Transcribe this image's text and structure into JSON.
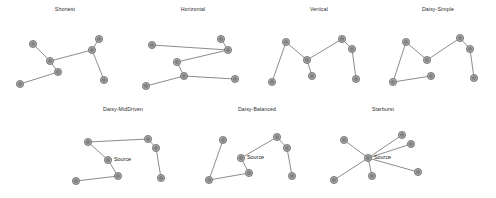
{
  "figure": {
    "width": 496,
    "height": 198,
    "background": "#ffffff",
    "node_fill": "#a6a6a6",
    "node_stroke": "#6a6a6a",
    "edge_color": "#6e6e6e",
    "title_color": "#2b2b2b",
    "node_radius": 3.6,
    "node_inner_radius": 1.5
  },
  "panels": [
    {
      "id": "shortest",
      "title": "Shortest",
      "box": {
        "left": 4,
        "top": 6,
        "width": 122,
        "height": 92
      },
      "view": {
        "width": 122,
        "height": 82
      },
      "nodes": [
        {
          "name": "node-a",
          "x": 29,
          "y": 30
        },
        {
          "name": "node-b",
          "x": 46,
          "y": 47
        },
        {
          "name": "node-c",
          "x": 54,
          "y": 58
        },
        {
          "name": "node-d",
          "x": 16,
          "y": 70
        },
        {
          "name": "node-e",
          "x": 88,
          "y": 36
        },
        {
          "name": "node-f",
          "x": 95,
          "y": 25
        },
        {
          "name": "node-g",
          "x": 100,
          "y": 66
        }
      ],
      "edges": [
        [
          0,
          1
        ],
        [
          1,
          2
        ],
        [
          2,
          3
        ],
        [
          1,
          4
        ],
        [
          4,
          5
        ],
        [
          4,
          6
        ]
      ],
      "labels": []
    },
    {
      "id": "horizontal",
      "title": "Horizontal",
      "box": {
        "left": 132,
        "top": 6,
        "width": 122,
        "height": 92
      },
      "view": {
        "width": 122,
        "height": 82
      },
      "nodes": [
        {
          "name": "node-a",
          "x": 20,
          "y": 31
        },
        {
          "name": "node-b",
          "x": 96,
          "y": 36
        },
        {
          "name": "node-c",
          "x": 89,
          "y": 25
        },
        {
          "name": "node-d",
          "x": 45,
          "y": 48
        },
        {
          "name": "node-e",
          "x": 52,
          "y": 62
        },
        {
          "name": "node-f",
          "x": 14,
          "y": 72
        },
        {
          "name": "node-g",
          "x": 103,
          "y": 65
        }
      ],
      "edges": [
        [
          0,
          1
        ],
        [
          1,
          2
        ],
        [
          1,
          3
        ],
        [
          3,
          4
        ],
        [
          4,
          5
        ],
        [
          4,
          6
        ]
      ],
      "labels": []
    },
    {
      "id": "vertical",
      "title": "Vertical",
      "box": {
        "left": 258,
        "top": 6,
        "width": 122,
        "height": 92
      },
      "view": {
        "width": 122,
        "height": 82
      },
      "nodes": [
        {
          "name": "node-a",
          "x": 28,
          "y": 28
        },
        {
          "name": "node-b",
          "x": 14,
          "y": 68
        },
        {
          "name": "node-c",
          "x": 49,
          "y": 46
        },
        {
          "name": "node-d",
          "x": 54,
          "y": 62
        },
        {
          "name": "node-e",
          "x": 84,
          "y": 25
        },
        {
          "name": "node-f",
          "x": 94,
          "y": 35
        },
        {
          "name": "node-g",
          "x": 98,
          "y": 65
        }
      ],
      "edges": [
        [
          0,
          1
        ],
        [
          0,
          2
        ],
        [
          2,
          3
        ],
        [
          2,
          4
        ],
        [
          4,
          5
        ],
        [
          5,
          6
        ]
      ],
      "labels": []
    },
    {
      "id": "daisy-simple",
      "title": "Daisy-Simple",
      "box": {
        "left": 380,
        "top": 6,
        "width": 116,
        "height": 92
      },
      "view": {
        "width": 116,
        "height": 82
      },
      "nodes": [
        {
          "name": "node-a",
          "x": 26,
          "y": 28
        },
        {
          "name": "node-b",
          "x": 13,
          "y": 68
        },
        {
          "name": "node-c",
          "x": 47,
          "y": 46
        },
        {
          "name": "node-d",
          "x": 51,
          "y": 62
        },
        {
          "name": "node-e",
          "x": 80,
          "y": 24
        },
        {
          "name": "node-f",
          "x": 90,
          "y": 35
        },
        {
          "name": "node-g",
          "x": 94,
          "y": 64
        }
      ],
      "edges": [
        [
          0,
          1
        ],
        [
          0,
          2
        ],
        [
          1,
          3
        ],
        [
          2,
          4
        ],
        [
          4,
          5
        ],
        [
          5,
          6
        ]
      ],
      "labels": []
    },
    {
      "id": "daisy-middriven",
      "title": "Daisy-MidDriven",
      "box": {
        "left": 62,
        "top": 106,
        "width": 122,
        "height": 90
      },
      "view": {
        "width": 122,
        "height": 80
      },
      "nodes": [
        {
          "name": "node-a",
          "x": 26,
          "y": 28
        },
        {
          "name": "node-source",
          "x": 46,
          "y": 46
        },
        {
          "name": "node-c",
          "x": 14,
          "y": 67
        },
        {
          "name": "node-d",
          "x": 56,
          "y": 62
        },
        {
          "name": "node-e",
          "x": 86,
          "y": 25
        },
        {
          "name": "node-f",
          "x": 94,
          "y": 34
        },
        {
          "name": "node-g",
          "x": 99,
          "y": 64
        }
      ],
      "edges": [
        [
          0,
          1
        ],
        [
          0,
          4
        ],
        [
          1,
          3
        ],
        [
          2,
          3
        ],
        [
          4,
          5
        ],
        [
          5,
          6
        ]
      ],
      "labels": [
        {
          "name": "source-label",
          "text": "Source",
          "x": 52,
          "y": 42
        }
      ]
    },
    {
      "id": "daisy-balanced",
      "title": "Daisy-Balanced",
      "box": {
        "left": 196,
        "top": 106,
        "width": 122,
        "height": 90
      },
      "view": {
        "width": 122,
        "height": 80
      },
      "nodes": [
        {
          "name": "node-a",
          "x": 27,
          "y": 26
        },
        {
          "name": "node-source",
          "x": 45,
          "y": 44
        },
        {
          "name": "node-c",
          "x": 13,
          "y": 66
        },
        {
          "name": "node-d",
          "x": 53,
          "y": 59
        },
        {
          "name": "node-e",
          "x": 81,
          "y": 23
        },
        {
          "name": "node-f",
          "x": 91,
          "y": 34
        },
        {
          "name": "node-g",
          "x": 96,
          "y": 62
        }
      ],
      "edges": [
        [
          0,
          2
        ],
        [
          1,
          3
        ],
        [
          1,
          4
        ],
        [
          2,
          3
        ],
        [
          4,
          5
        ],
        [
          5,
          6
        ]
      ],
      "labels": [
        {
          "name": "source-label",
          "text": "Source",
          "x": 51,
          "y": 40
        }
      ]
    },
    {
      "id": "starburst",
      "title": "Starburst",
      "box": {
        "left": 322,
        "top": 106,
        "width": 122,
        "height": 90
      },
      "view": {
        "width": 122,
        "height": 80
      },
      "nodes": [
        {
          "name": "node-source",
          "x": 46,
          "y": 44
        },
        {
          "name": "node-b",
          "x": 22,
          "y": 26
        },
        {
          "name": "node-c",
          "x": 12,
          "y": 66
        },
        {
          "name": "node-d",
          "x": 50,
          "y": 62
        },
        {
          "name": "node-e",
          "x": 80,
          "y": 21
        },
        {
          "name": "node-f",
          "x": 89,
          "y": 30
        },
        {
          "name": "node-g",
          "x": 96,
          "y": 58
        }
      ],
      "edges": [
        [
          0,
          1
        ],
        [
          0,
          2
        ],
        [
          0,
          3
        ],
        [
          0,
          4
        ],
        [
          0,
          5
        ],
        [
          0,
          6
        ]
      ],
      "labels": [
        {
          "name": "source-label",
          "text": "Source",
          "x": 52,
          "y": 40
        }
      ]
    }
  ]
}
